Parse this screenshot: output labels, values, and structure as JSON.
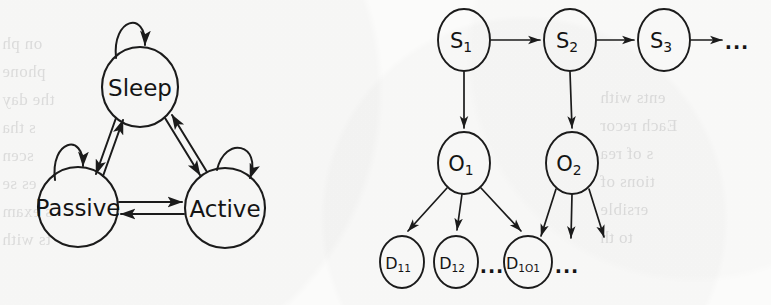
{
  "figure": {
    "background_color": "#fbfbfa",
    "ink_color": "#1b1b1b",
    "panels": [
      {
        "id": "state-transition-diagram",
        "type": "state-machine",
        "description": "Three-state transition diagram with self-loops and bidirectional transitions"
      },
      {
        "id": "temporal-graphical-model",
        "type": "directed-graph",
        "description": "Chain of latent states emitting observations which emit detections"
      }
    ]
  },
  "state_diagram": {
    "nodes": [
      {
        "id": "sleep",
        "label": "Sleep",
        "cx": 140,
        "cy": 87,
        "rx": 38,
        "ry": 40,
        "self_loop": true
      },
      {
        "id": "passive",
        "label": "Passive",
        "cx": 78,
        "cy": 207,
        "rx": 40,
        "ry": 40,
        "self_loop": true
      },
      {
        "id": "active",
        "label": "Active",
        "cx": 225,
        "cy": 208,
        "rx": 40,
        "ry": 40,
        "self_loop": true
      }
    ],
    "edges": [
      {
        "from": "sleep",
        "to": "passive",
        "style": "double-line",
        "bidirectional": true
      },
      {
        "from": "sleep",
        "to": "active",
        "style": "double-line",
        "bidirectional": true
      },
      {
        "from": "passive",
        "to": "active",
        "style": "double-line",
        "bidirectional": true
      }
    ]
  },
  "graphical_model": {
    "state_nodes": [
      {
        "id": "s1",
        "base": "S",
        "subscript": "1",
        "cx": 464,
        "cy": 40,
        "rx": 26,
        "ry": 31
      },
      {
        "id": "s2",
        "base": "S",
        "subscript": "2",
        "cx": 570,
        "cy": 40,
        "rx": 26,
        "ry": 31
      },
      {
        "id": "s3",
        "base": "S",
        "subscript": "3",
        "cx": 664,
        "cy": 40,
        "rx": 26,
        "ry": 31
      }
    ],
    "observation_nodes": [
      {
        "id": "o1",
        "base": "O",
        "subscript": "1",
        "cx": 464,
        "cy": 163,
        "rx": 26,
        "ry": 31
      },
      {
        "id": "o2",
        "base": "O",
        "subscript": "2",
        "cx": 572,
        "cy": 163,
        "rx": 26,
        "ry": 31
      }
    ],
    "detection_nodes": [
      {
        "id": "d11",
        "base": "D",
        "subscript": "11",
        "cx": 402,
        "cy": 262,
        "rx": 22,
        "ry": 26
      },
      {
        "id": "d12",
        "base": "D",
        "subscript": "12",
        "cx": 456,
        "cy": 262,
        "rx": 22,
        "ry": 26
      },
      {
        "id": "d1o1",
        "base": "D",
        "subscript": "1O1",
        "cx": 528,
        "cy": 262,
        "rx": 24,
        "ry": 26
      }
    ],
    "ellipses_marks": [
      {
        "id": "chain-ellipsis",
        "text": "...",
        "x": 737,
        "y": 42
      },
      {
        "id": "detection-ellipsis",
        "text": "...",
        "x": 492,
        "y": 266
      },
      {
        "id": "o2-child-ellipsis",
        "text": "...",
        "x": 567,
        "y": 266
      }
    ],
    "edges": [
      {
        "from": "s1",
        "to": "s2",
        "kind": "transition"
      },
      {
        "from": "s2",
        "to": "s3",
        "kind": "transition"
      },
      {
        "from": "s3",
        "to": "chain-ellipsis",
        "kind": "transition"
      },
      {
        "from": "s1",
        "to": "o1",
        "kind": "emission"
      },
      {
        "from": "s2",
        "to": "o2",
        "kind": "emission"
      },
      {
        "from": "o1",
        "to": "d11",
        "kind": "detection"
      },
      {
        "from": "o1",
        "to": "d12",
        "kind": "detection"
      },
      {
        "from": "o1",
        "to": "d1o1",
        "kind": "detection"
      },
      {
        "from": "o2",
        "to": "unnamed-1",
        "kind": "detection"
      },
      {
        "from": "o2",
        "to": "unnamed-2",
        "kind": "detection"
      },
      {
        "from": "o2",
        "to": "unnamed-3",
        "kind": "detection"
      }
    ]
  },
  "bleed_through_text": {
    "left_column": [
      "on ph",
      "phone",
      "the day",
      "s tha",
      "scen",
      "es se",
      "s exam",
      "ts with"
    ],
    "right_column": [
      "ents with",
      "Each recor",
      "s of rea",
      "tions of",
      "ersible",
      "to th"
    ]
  }
}
